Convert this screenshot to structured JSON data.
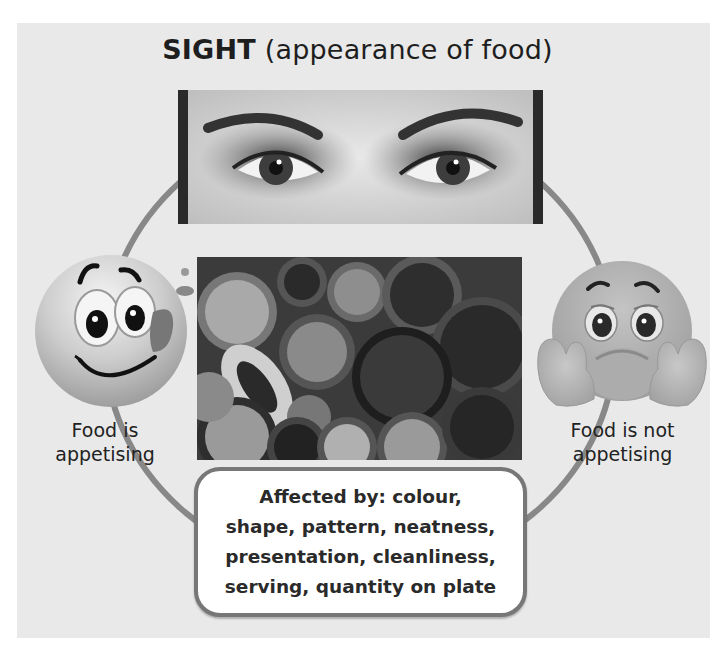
{
  "title": {
    "strong": "SIGHT",
    "rest": " (appearance of food)"
  },
  "images": {
    "eyes_photo": "close-up of a person's eyes",
    "food_photo": "overhead view of many dishes of food"
  },
  "left": {
    "emoji": "happy-licking-lips-emoji",
    "label_line1": "Food is",
    "label_line2": "appetising"
  },
  "right": {
    "emoji": "sad-bored-emoji",
    "label_line1": "Food is not",
    "label_line2": "appetising"
  },
  "box": {
    "lines": [
      "Affected by: colour,",
      "shape, pattern, neatness,",
      "presentation, cleanliness,",
      "serving, quantity on plate"
    ]
  },
  "colors": {
    "panel": "#e9e9e9",
    "ring": "#888888",
    "box_border": "#777777",
    "text": "#222222"
  }
}
